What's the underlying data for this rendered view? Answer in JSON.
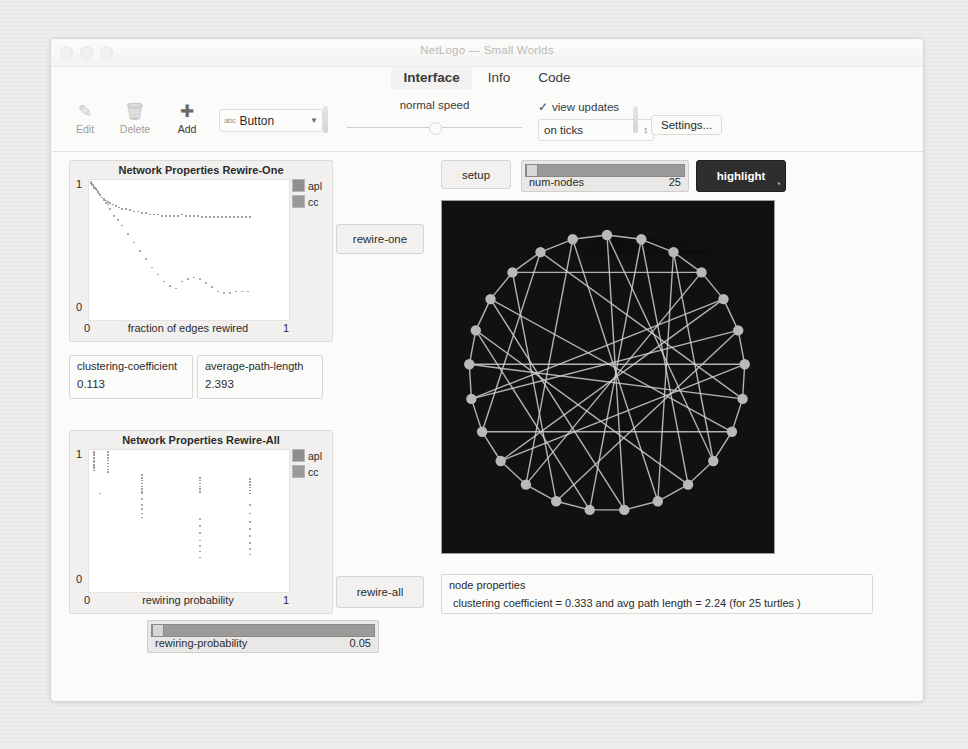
{
  "window": {
    "title": "NetLogo — Small Worlds",
    "controls": [
      "close",
      "minimize",
      "zoom"
    ]
  },
  "tabs": [
    {
      "label": "Interface",
      "active": true
    },
    {
      "label": "Info",
      "active": false
    },
    {
      "label": "Code",
      "active": false
    }
  ],
  "toolbar": {
    "edit": {
      "label": "Edit",
      "icon": "pencil-icon",
      "glyph": "✎",
      "enabled": false
    },
    "delete": {
      "label": "Delete",
      "icon": "trash-icon",
      "glyph": "🗑",
      "enabled": false
    },
    "add": {
      "label": "Add",
      "icon": "plus-icon",
      "glyph": "✚",
      "enabled": true
    },
    "widget_select": {
      "value": "Button",
      "abc": "abc",
      "arrow": "▼"
    },
    "speed": {
      "label": "normal speed",
      "position_pct": 47
    },
    "view_updates": {
      "label": "view updates",
      "checked": true,
      "check": "✓"
    },
    "update_mode": {
      "value": "on ticks",
      "spinner": "⌃⌄"
    },
    "settings_button": {
      "label": "Settings..."
    }
  },
  "plots": [
    {
      "title": "Network Properties Rewire-One",
      "xtitle": "fraction of edges rewired",
      "ymax_label": "1",
      "ymin_label": "0",
      "xmin_label": "0",
      "xmax_label": "1",
      "legend": [
        {
          "name": "apl",
          "color": "#8f8f8f"
        },
        {
          "name": "cc",
          "color": "#9a9a9a"
        }
      ]
    },
    {
      "title": "Network Properties Rewire-All",
      "xtitle": "rewiring probability",
      "ymax_label": "1",
      "ymin_label": "0",
      "xmin_label": "0",
      "xmax_label": "1",
      "legend": [
        {
          "name": "apl",
          "color": "#8f8f8f"
        },
        {
          "name": "cc",
          "color": "#9a9a9a"
        }
      ]
    }
  ],
  "chart_data": [
    {
      "type": "scatter",
      "title": "Network Properties Rewire-One",
      "xlabel": "fraction of edges rewired",
      "ylabel": "",
      "xlim": [
        0,
        1
      ],
      "ylim": [
        0,
        1
      ],
      "grid": false,
      "legend_position": "top-right",
      "series": [
        {
          "name": "apl",
          "color": "#8f8f8f",
          "x": [
            0.005,
            0.012,
            0.018,
            0.02,
            0.025,
            0.03,
            0.035,
            0.04,
            0.045,
            0.05,
            0.06,
            0.07,
            0.08,
            0.09,
            0.1,
            0.115,
            0.13,
            0.145,
            0.16,
            0.18,
            0.2,
            0.22,
            0.24,
            0.26,
            0.28,
            0.3,
            0.32,
            0.34,
            0.36,
            0.38,
            0.4,
            0.42,
            0.44,
            0.46,
            0.48,
            0.5,
            0.52,
            0.54,
            0.56,
            0.58,
            0.6,
            0.62,
            0.64,
            0.66,
            0.68,
            0.7,
            0.72,
            0.74,
            0.76,
            0.78,
            0.8
          ],
          "y": [
            0.98,
            0.97,
            0.96,
            0.95,
            0.95,
            0.94,
            0.93,
            0.92,
            0.91,
            0.9,
            0.88,
            0.87,
            0.86,
            0.85,
            0.84,
            0.83,
            0.82,
            0.81,
            0.8,
            0.8,
            0.79,
            0.78,
            0.78,
            0.77,
            0.77,
            0.76,
            0.76,
            0.76,
            0.75,
            0.75,
            0.75,
            0.75,
            0.75,
            0.76,
            0.75,
            0.75,
            0.75,
            0.75,
            0.74,
            0.74,
            0.74,
            0.74,
            0.74,
            0.74,
            0.74,
            0.74,
            0.74,
            0.74,
            0.74,
            0.74,
            0.74
          ]
        },
        {
          "name": "cc",
          "color": "#9a9a9a",
          "x": [
            0.005,
            0.01,
            0.015,
            0.02,
            0.025,
            0.03,
            0.04,
            0.05,
            0.06,
            0.07,
            0.08,
            0.09,
            0.1,
            0.12,
            0.14,
            0.16,
            0.19,
            0.22,
            0.25,
            0.28,
            0.31,
            0.34,
            0.37,
            0.4,
            0.43,
            0.46,
            0.49,
            0.52,
            0.55,
            0.58,
            0.61,
            0.64,
            0.67,
            0.7,
            0.73,
            0.76,
            0.79
          ],
          "y": [
            0.99,
            0.98,
            0.97,
            0.96,
            0.95,
            0.94,
            0.92,
            0.9,
            0.88,
            0.86,
            0.84,
            0.83,
            0.8,
            0.75,
            0.72,
            0.68,
            0.62,
            0.56,
            0.5,
            0.44,
            0.38,
            0.33,
            0.28,
            0.25,
            0.23,
            0.28,
            0.3,
            0.31,
            0.3,
            0.27,
            0.24,
            0.21,
            0.2,
            0.2,
            0.21,
            0.21,
            0.21
          ]
        }
      ]
    },
    {
      "type": "scatter",
      "title": "Network Properties Rewire-All",
      "xlabel": "rewiring probability",
      "ylabel": "",
      "xlim": [
        0,
        1
      ],
      "ylim": [
        0,
        1
      ],
      "grid": false,
      "legend_position": "top-right",
      "series": [
        {
          "name": "apl",
          "color": "#8f8f8f",
          "x": [
            0.02,
            0.02,
            0.02,
            0.02,
            0.02,
            0.02,
            0.02,
            0.02,
            0.09,
            0.09,
            0.09,
            0.09,
            0.09,
            0.09,
            0.09,
            0.09,
            0.26,
            0.26,
            0.26,
            0.26,
            0.26,
            0.26,
            0.26,
            0.55,
            0.55,
            0.55,
            0.55,
            0.55,
            0.55,
            0.8,
            0.8,
            0.8,
            0.8,
            0.8,
            0.8
          ],
          "y": [
            0.99,
            0.97,
            0.95,
            0.93,
            0.92,
            0.9,
            0.88,
            0.86,
            0.99,
            0.97,
            0.95,
            0.93,
            0.91,
            0.89,
            0.87,
            0.85,
            0.83,
            0.81,
            0.79,
            0.77,
            0.75,
            0.73,
            0.71,
            0.81,
            0.79,
            0.77,
            0.75,
            0.73,
            0.71,
            0.8,
            0.78,
            0.76,
            0.74,
            0.72,
            0.7
          ]
        },
        {
          "name": "cc",
          "color": "#9a9a9a",
          "x": [
            0.02,
            0.02,
            0.02,
            0.02,
            0.02,
            0.05,
            0.09,
            0.26,
            0.26,
            0.26,
            0.26,
            0.26,
            0.26,
            0.55,
            0.55,
            0.55,
            0.55,
            0.55,
            0.55,
            0.55,
            0.8,
            0.8,
            0.8,
            0.8,
            0.8,
            0.8,
            0.8,
            0.8
          ],
          "y": [
            0.98,
            0.95,
            0.92,
            0.89,
            0.86,
            0.7,
            0.85,
            0.7,
            0.66,
            0.62,
            0.59,
            0.56,
            0.53,
            0.52,
            0.47,
            0.42,
            0.37,
            0.33,
            0.29,
            0.25,
            0.62,
            0.56,
            0.5,
            0.45,
            0.4,
            0.35,
            0.31,
            0.27
          ]
        }
      ]
    }
  ],
  "monitors": [
    {
      "label": "clustering-coefficient",
      "value": "0.113"
    },
    {
      "label": "average-path-length",
      "value": "2.393"
    }
  ],
  "buttons": {
    "setup": {
      "label": "setup",
      "dark": false
    },
    "highlight": {
      "label": "highlight",
      "dark": true,
      "agent_mark": "◔"
    },
    "rewire_one": {
      "label": "rewire-one",
      "dark": false
    },
    "rewire_all": {
      "label": "rewire-all",
      "dark": false
    }
  },
  "sliders": [
    {
      "name": "num-nodes",
      "value": "25",
      "fill_pct": 100,
      "thumb_pct": 4
    },
    {
      "name": "rewiring-probability",
      "value": "0.05",
      "fill_pct": 100,
      "thumb_pct": 3
    }
  ],
  "output": {
    "label": "node properties",
    "text": "clustering coefficient = 0.333 and avg path length = 2.24 (for 25 turtles )"
  },
  "view": {
    "background": "#111111",
    "node_color": "#b9b9b9",
    "link_color": "#cfcfcf",
    "node_count": 25
  },
  "statusbar": {
    "glyphs": "▲ ⚲"
  }
}
